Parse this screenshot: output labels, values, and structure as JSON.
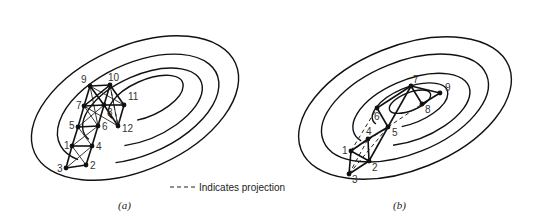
{
  "legend": {
    "dashed_meaning": "Indicates projection",
    "prefix": "----"
  },
  "panels": [
    {
      "id": "a",
      "caption": "(a)",
      "nodes": [
        {
          "label": "1"
        },
        {
          "label": "2"
        },
        {
          "label": "3"
        },
        {
          "label": "4"
        },
        {
          "label": "5"
        },
        {
          "label": "6"
        },
        {
          "label": "7"
        },
        {
          "label": "8"
        },
        {
          "label": "9"
        },
        {
          "label": "10"
        },
        {
          "label": "11"
        },
        {
          "label": "12"
        }
      ]
    },
    {
      "id": "b",
      "caption": "(b)",
      "nodes": [
        {
          "label": "1"
        },
        {
          "label": "2"
        },
        {
          "label": "3"
        },
        {
          "label": "4"
        },
        {
          "label": "5"
        },
        {
          "label": "6"
        },
        {
          "label": "7"
        },
        {
          "label": "8"
        },
        {
          "label": "9"
        }
      ]
    }
  ],
  "colors": {
    "ink": "#111111",
    "background": "#ffffff"
  }
}
